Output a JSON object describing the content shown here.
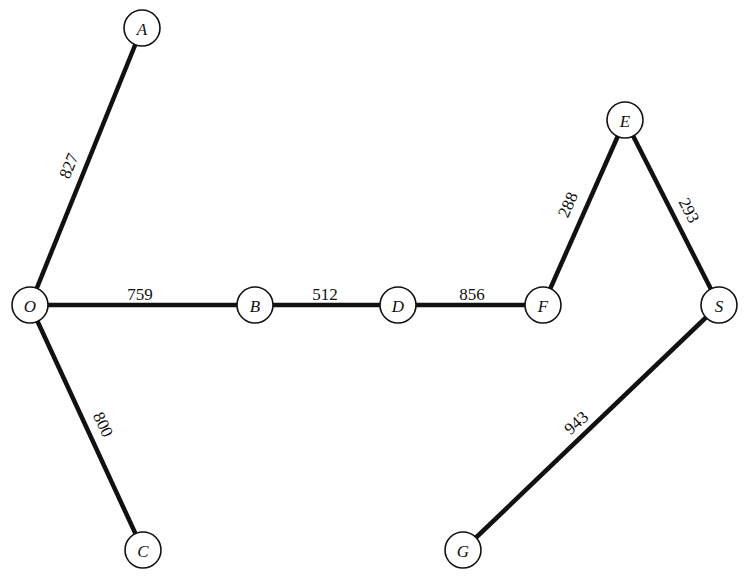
{
  "diagram": {
    "type": "weighted-tree-graph",
    "node_radius": 18,
    "nodes": [
      {
        "id": "A",
        "label": "A",
        "x": 142,
        "y": 28
      },
      {
        "id": "O",
        "label": "O",
        "x": 30,
        "y": 305
      },
      {
        "id": "B",
        "label": "B",
        "x": 255,
        "y": 305
      },
      {
        "id": "D",
        "label": "D",
        "x": 398,
        "y": 305
      },
      {
        "id": "F",
        "label": "F",
        "x": 543,
        "y": 305
      },
      {
        "id": "E",
        "label": "E",
        "x": 625,
        "y": 120
      },
      {
        "id": "S",
        "label": "S",
        "x": 719,
        "y": 305
      },
      {
        "id": "C",
        "label": "C",
        "x": 143,
        "y": 550
      },
      {
        "id": "G",
        "label": "G",
        "x": 463,
        "y": 550
      }
    ],
    "edges": [
      {
        "from": "O",
        "to": "A",
        "weight": "827",
        "lx": 74,
        "ly": 168,
        "angle": -68,
        "side": -1
      },
      {
        "from": "O",
        "to": "B",
        "weight": "759",
        "lx": 140,
        "ly": 300,
        "angle": 0,
        "side": -1
      },
      {
        "from": "B",
        "to": "D",
        "weight": "512",
        "lx": 325,
        "ly": 300,
        "angle": 0,
        "side": -1
      },
      {
        "from": "D",
        "to": "F",
        "weight": "856",
        "lx": 472,
        "ly": 300,
        "angle": 0,
        "side": -1
      },
      {
        "from": "F",
        "to": "E",
        "weight": "288",
        "lx": 573,
        "ly": 207,
        "angle": -66,
        "side": -1
      },
      {
        "from": "E",
        "to": "S",
        "weight": "293",
        "lx": 684,
        "ly": 213,
        "angle": 63,
        "side": 1
      },
      {
        "from": "O",
        "to": "C",
        "weight": "800",
        "lx": 98,
        "ly": 427,
        "angle": 64,
        "side": 1
      },
      {
        "from": "S",
        "to": "G",
        "weight": "943",
        "lx": 580,
        "ly": 427,
        "angle": -42,
        "side": -1
      }
    ]
  }
}
